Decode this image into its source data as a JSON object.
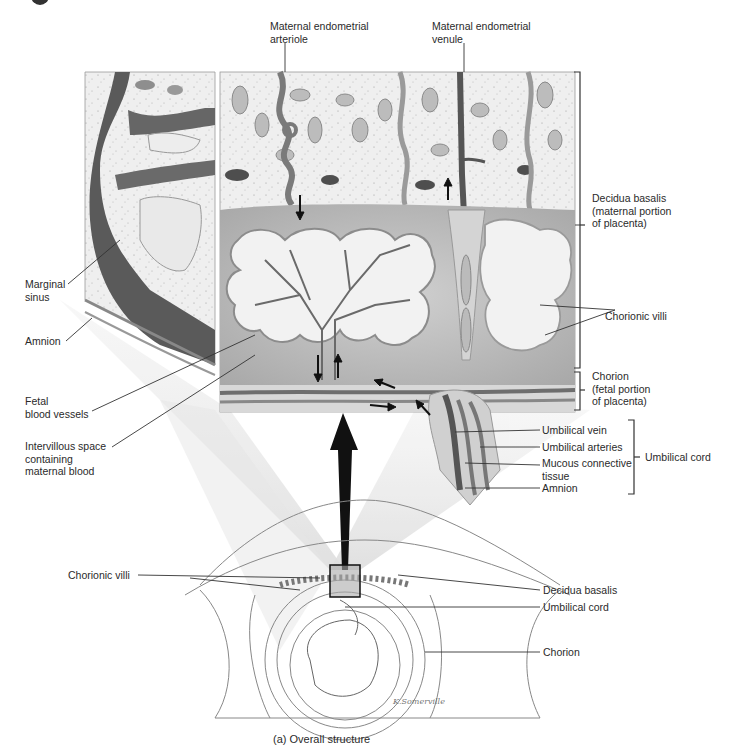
{
  "figure": {
    "caption": "(a) Overall structure",
    "signature": "K.Somerville"
  },
  "labels": {
    "top": [
      {
        "id": "maternal-endometrial-arteriole",
        "text": "Maternal endometrial\narteriole"
      },
      {
        "id": "maternal-endometrial-venule",
        "text": "Maternal endometrial\nvenule"
      }
    ],
    "left": [
      {
        "id": "marginal-sinus",
        "text": "Marginal\nsinus"
      },
      {
        "id": "amnion-left",
        "text": "Amnion"
      },
      {
        "id": "fetal-blood-vessels",
        "text": "Fetal\nblood vessels"
      },
      {
        "id": "intervillous-space",
        "text": "Intervillous space\ncontaining\nmaternal blood"
      },
      {
        "id": "chorionic-villi-lower",
        "text": "Chorionic villi"
      }
    ],
    "right": [
      {
        "id": "decidua-basalis-maternal",
        "text": "Decidua basalis\n(maternal portion\nof placenta)"
      },
      {
        "id": "chorionic-villi-right",
        "text": "Chorionic villi"
      },
      {
        "id": "chorion-fetal",
        "text": "Chorion\n(fetal portion\nof placenta)"
      },
      {
        "id": "umbilical-vein",
        "text": "Umbilical vein"
      },
      {
        "id": "umbilical-arteries",
        "text": "Umbilical arteries"
      },
      {
        "id": "mucous-connective-tissue",
        "text": "Mucous connective\ntissue"
      },
      {
        "id": "amnion-right",
        "text": "Amnion"
      },
      {
        "id": "umbilical-cord-group",
        "text": "Umbilical cord"
      },
      {
        "id": "decidua-basalis-lower",
        "text": "Decidua basalis"
      },
      {
        "id": "umbilical-cord-lower",
        "text": "Umbilical cord"
      },
      {
        "id": "chorion-lower",
        "text": "Chorion"
      }
    ]
  },
  "colors": {
    "tissue_light": "#ececec",
    "tissue_mid": "#bdbdbd",
    "vessel_dark": "#6a6a6a",
    "sinus_dark": "#555555",
    "line": "#333333",
    "arrow": "#111111"
  }
}
